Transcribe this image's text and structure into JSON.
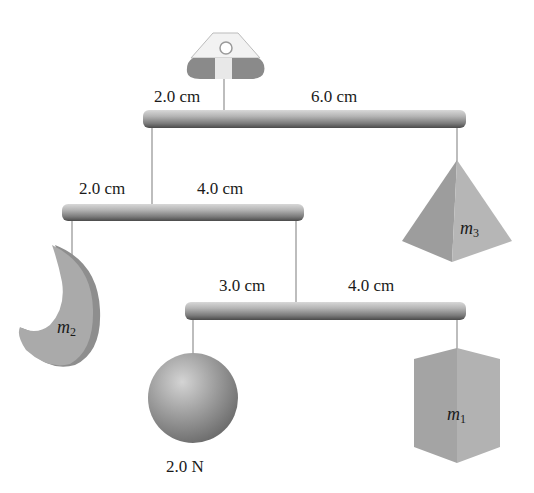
{
  "figure": {
    "colors": {
      "rod": "#9a9a9a",
      "string": "#bdbdbd",
      "object_fill": "#a8a8a8",
      "object_shade": "#8c8c8c",
      "label": "#1a1a1a"
    }
  },
  "top_rod": {
    "left_distance": "2.0 cm",
    "right_distance": "6.0 cm"
  },
  "middle_rod": {
    "left_distance": "2.0 cm",
    "right_distance": "4.0 cm"
  },
  "bottom_rod": {
    "left_distance": "3.0 cm",
    "right_distance": "4.0 cm"
  },
  "objects": {
    "m1": {
      "symbol": "m",
      "subscript": "1",
      "shape": "box"
    },
    "m2": {
      "symbol": "m",
      "subscript": "2",
      "shape": "crescent"
    },
    "m3": {
      "symbol": "m",
      "subscript": "3",
      "shape": "pyramid"
    },
    "sphere": {
      "weight_label": "2.0 N",
      "shape": "sphere"
    }
  }
}
